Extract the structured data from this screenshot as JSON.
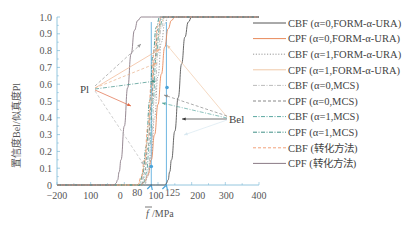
{
  "chart_data": {
    "type": "line",
    "title": "",
    "xlabel": "f̄ /MPa",
    "ylabel": "置信度Bel/似真度Pl",
    "xlim": [
      -200,
      400
    ],
    "ylim": [
      0,
      1.0
    ],
    "x_ticks": [
      "-200",
      "100",
      "0",
      "80",
      "100",
      "125",
      "200",
      "300",
      "400"
    ],
    "x_tick_values": [
      -200,
      -100,
      0,
      80,
      100,
      125,
      200,
      300,
      400
    ],
    "y_ticks": [
      "0",
      "0.1",
      "0.2",
      "0.3",
      "0.4",
      "0.5",
      "0.6",
      "0.7",
      "0.8",
      "0.9",
      "1.0"
    ],
    "grid": false,
    "legend_position": "right",
    "annotations": [
      {
        "text": "Pl",
        "x": -110,
        "y": 0.55
      },
      {
        "text": "Bel",
        "x": 280,
        "y": 0.43
      }
    ],
    "reference_lines": [
      {
        "x": 80,
        "color": "#4aa3d9"
      },
      {
        "x": 125,
        "color": "#4aa3d9"
      }
    ],
    "series": [
      {
        "name": "CBF (α=0,FORM-α-URA)",
        "color": "#555555",
        "dash": "solid",
        "x": [
          120,
          125,
          130,
          135,
          140,
          150,
          160,
          170,
          180,
          190,
          200,
          400
        ],
        "y": [
          0,
          0.01,
          0.03,
          0.08,
          0.15,
          0.32,
          0.52,
          0.72,
          0.88,
          0.97,
          1.0,
          1.0
        ]
      },
      {
        "name": "CPF (α=0,FORM-α-URA)",
        "color": "#e8895a",
        "dash": "solid",
        "x": [
          50,
          60,
          70,
          80,
          90,
          100,
          110,
          120,
          130,
          140,
          150,
          400
        ],
        "y": [
          0,
          0.02,
          0.06,
          0.15,
          0.3,
          0.48,
          0.66,
          0.82,
          0.93,
          0.98,
          1.0,
          1.0
        ]
      },
      {
        "name": "CBF (α=1,FORM-α-URA)",
        "color": "#999999",
        "dash": "dotted",
        "x": [
          60,
          70,
          80,
          90,
          100,
          110,
          120,
          130,
          400
        ],
        "y": [
          0,
          0.05,
          0.18,
          0.4,
          0.65,
          0.85,
          0.96,
          1.0,
          1.0
        ]
      },
      {
        "name": "CPF (α=1,FORM-α-URA)",
        "color": "#f0c9a8",
        "dash": "solid",
        "x": [
          40,
          50,
          60,
          70,
          80,
          90,
          100,
          110,
          120,
          400
        ],
        "y": [
          0,
          0.04,
          0.12,
          0.28,
          0.5,
          0.72,
          0.88,
          0.97,
          1.0,
          1.0
        ]
      },
      {
        "name": "CBF (α=0,MCS)",
        "color": "#bbbbbb",
        "dash": "dashdot",
        "x": [
          60,
          70,
          80,
          90,
          100,
          110,
          120,
          400
        ],
        "y": [
          0,
          0.08,
          0.25,
          0.52,
          0.78,
          0.94,
          1.0,
          1.0
        ]
      },
      {
        "name": "CPF (α=0,MCS)",
        "color": "#888888",
        "dash": "dashed",
        "x": [
          50,
          60,
          70,
          80,
          90,
          100,
          110,
          400
        ],
        "y": [
          0,
          0.07,
          0.22,
          0.48,
          0.75,
          0.93,
          1.0,
          1.0
        ]
      },
      {
        "name": "CBF (α=1,MCS)",
        "color": "#5aa7a0",
        "dash": "dashdot",
        "x": [
          55,
          65,
          75,
          85,
          95,
          105,
          115,
          400
        ],
        "y": [
          0,
          0.07,
          0.24,
          0.5,
          0.77,
          0.94,
          1.0,
          1.0
        ]
      },
      {
        "name": "CPF (α=1,MCS)",
        "color": "#3f8f86",
        "dash": "dashdot",
        "x": [
          45,
          55,
          65,
          75,
          85,
          95,
          105,
          400
        ],
        "y": [
          0,
          0.07,
          0.23,
          0.5,
          0.77,
          0.94,
          1.0,
          1.0
        ]
      },
      {
        "name": "CBF (转化方法)",
        "color": "#f2a27a",
        "dash": "dashed",
        "x": [
          40,
          50,
          60,
          70,
          80,
          90,
          100,
          110,
          400
        ],
        "y": [
          0,
          0.05,
          0.15,
          0.35,
          0.6,
          0.82,
          0.95,
          1.0,
          1.0
        ]
      },
      {
        "name": "CPF (转化方法)",
        "color": "#8a7a86",
        "dash": "solid",
        "x": [
          -30,
          -25,
          -20,
          -15,
          -10,
          0,
          10,
          20,
          30,
          40,
          50,
          400
        ],
        "y": [
          0,
          0.01,
          0.03,
          0.08,
          0.15,
          0.35,
          0.58,
          0.78,
          0.92,
          0.98,
          1.0,
          1.0
        ]
      }
    ]
  },
  "legend": {
    "items": [
      {
        "label": "CBF (α=0,FORM-α-URA)"
      },
      {
        "label": "CPF (α=0,FORM-α-URA)"
      },
      {
        "label": "CBF (α=1,FORM-α-URA)"
      },
      {
        "label": "CPF (α=1,FORM-α-URA)"
      },
      {
        "label": "CBF (α=0,MCS)"
      },
      {
        "label": "CPF (α=0,MCS)"
      },
      {
        "label": "CBF (α=1,MCS)"
      },
      {
        "label": "CPF (α=1,MCS)"
      },
      {
        "label": "CBF (转化方法)"
      },
      {
        "label": "CPF (转化方法)"
      }
    ]
  },
  "axes": {
    "ylabel": "置信度Bel/似真度Pl",
    "xlabel_f": "f",
    "xlabel_unit": "/MPa"
  },
  "annotations": {
    "pl": "Pl",
    "bel": "Bel"
  }
}
